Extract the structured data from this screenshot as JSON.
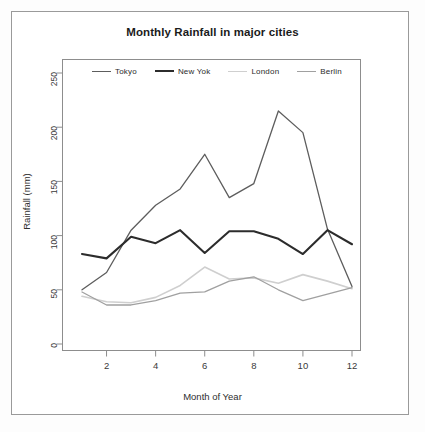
{
  "chart_data": {
    "type": "line",
    "title": "Monthly Rainfall in major cities",
    "xlabel": "Month of Year",
    "ylabel": "Rainfall (mm)",
    "x": [
      1,
      2,
      3,
      4,
      5,
      6,
      7,
      8,
      9,
      10,
      11,
      12
    ],
    "xlim": [
      1,
      12
    ],
    "ylim": [
      0,
      250
    ],
    "xticks": [
      "2",
      "4",
      "6",
      "8",
      "10",
      "12"
    ],
    "xtick_values": [
      2,
      4,
      6,
      8,
      10,
      12
    ],
    "yticks": [
      "0",
      "50",
      "100",
      "150",
      "200",
      "250"
    ],
    "ytick_values": [
      0,
      50,
      100,
      150,
      200,
      250
    ],
    "grid": false,
    "legend_position": "top-inside",
    "series": [
      {
        "name": "Tokyo",
        "color": "#5d5d5d",
        "width": 1.3,
        "values": [
          50,
          66,
          105,
          128,
          143,
          175,
          135,
          148,
          215,
          195,
          106,
          53
        ]
      },
      {
        "name": "New Yok",
        "color": "#2c2c2c",
        "width": 2.1,
        "values": [
          83,
          79,
          99,
          93,
          105,
          84,
          104,
          104,
          97,
          83,
          105,
          92
        ]
      },
      {
        "name": "London",
        "color": "#cfcfcf",
        "width": 1.6,
        "values": [
          44,
          39,
          38,
          43,
          54,
          71,
          60,
          61,
          56,
          64,
          58,
          51
        ]
      },
      {
        "name": "Berlin",
        "color": "#a0a0a0",
        "width": 1.3,
        "values": [
          48,
          36,
          36,
          40,
          47,
          48,
          58,
          62,
          50,
          40,
          46,
          52
        ]
      }
    ]
  },
  "legend": {
    "items": [
      {
        "label": "Tokyo",
        "color": "#5d5d5d",
        "width": 1.3
      },
      {
        "label": "New Yok",
        "color": "#2c2c2c",
        "width": 2.1
      },
      {
        "label": "London",
        "color": "#cfcfcf",
        "width": 1.6
      },
      {
        "label": "Berlin",
        "color": "#a0a0a0",
        "width": 1.3
      }
    ]
  },
  "axes": {
    "y_title": "Rainfall (mm)",
    "x_title": "Month of Year"
  }
}
